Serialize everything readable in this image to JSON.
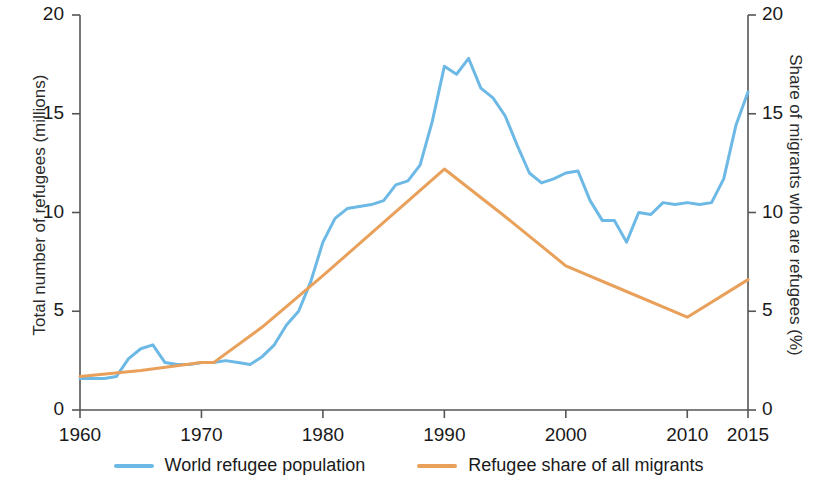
{
  "chart_data": {
    "type": "line",
    "title": "",
    "xlabel": "",
    "ylabel": "Total number of refugees (millions)",
    "ylabel_right": "Share of migrants who are refugees (%)",
    "xlim": [
      1960,
      2015
    ],
    "ylim": [
      0,
      20
    ],
    "ylim_right": [
      0,
      20
    ],
    "xticks": [
      1960,
      1970,
      1980,
      1990,
      2000,
      2010,
      2015
    ],
    "yticks": [
      0,
      5,
      10,
      15,
      20
    ],
    "yticks_right": [
      0,
      5,
      10,
      15,
      20
    ],
    "grid": false,
    "legend_position": "bottom-center",
    "series": [
      {
        "name": "World refugee population",
        "axis": "left",
        "color": "#6DB9E6",
        "unit": "millions",
        "x": [
          1960,
          1961,
          1962,
          1963,
          1964,
          1965,
          1966,
          1967,
          1968,
          1969,
          1970,
          1971,
          1972,
          1973,
          1974,
          1975,
          1976,
          1977,
          1978,
          1979,
          1980,
          1981,
          1982,
          1983,
          1984,
          1985,
          1986,
          1987,
          1988,
          1989,
          1990,
          1991,
          1992,
          1993,
          1994,
          1995,
          1996,
          1997,
          1998,
          1999,
          2000,
          2001,
          2002,
          2003,
          2004,
          2005,
          2006,
          2007,
          2008,
          2009,
          2010,
          2011,
          2012,
          2013,
          2014,
          2015
        ],
        "values": [
          1.6,
          1.6,
          1.6,
          1.7,
          2.6,
          3.1,
          3.3,
          2.4,
          2.3,
          2.3,
          2.4,
          2.4,
          2.5,
          2.4,
          2.3,
          2.7,
          3.3,
          4.3,
          5.0,
          6.5,
          8.5,
          9.7,
          10.2,
          10.3,
          10.4,
          10.6,
          11.4,
          11.6,
          12.4,
          14.6,
          17.4,
          17.0,
          17.8,
          16.3,
          15.8,
          14.9,
          13.4,
          12.0,
          11.5,
          11.7,
          12.0,
          12.1,
          10.6,
          9.6,
          9.6,
          8.5,
          10.0,
          9.9,
          10.5,
          10.4,
          10.5,
          10.4,
          10.5,
          11.7,
          14.4,
          16.1
        ]
      },
      {
        "name": "Refugee share of all migrants",
        "axis": "right",
        "color": "#E8A05A",
        "unit": "%",
        "x": [
          1960,
          1965,
          1970,
          1971,
          1975,
          1980,
          1985,
          1990,
          1995,
          2000,
          2005,
          2010,
          2015
        ],
        "values": [
          1.7,
          2.0,
          2.4,
          2.4,
          4.2,
          6.8,
          9.5,
          12.2,
          9.8,
          7.3,
          6.0,
          4.7,
          6.6
        ]
      }
    ],
    "annotations": []
  },
  "legend": {
    "items": [
      {
        "label": "World refugee population",
        "color": "#6DB9E6"
      },
      {
        "label": "Refugee share of all migrants",
        "color": "#E8A05A"
      }
    ]
  }
}
